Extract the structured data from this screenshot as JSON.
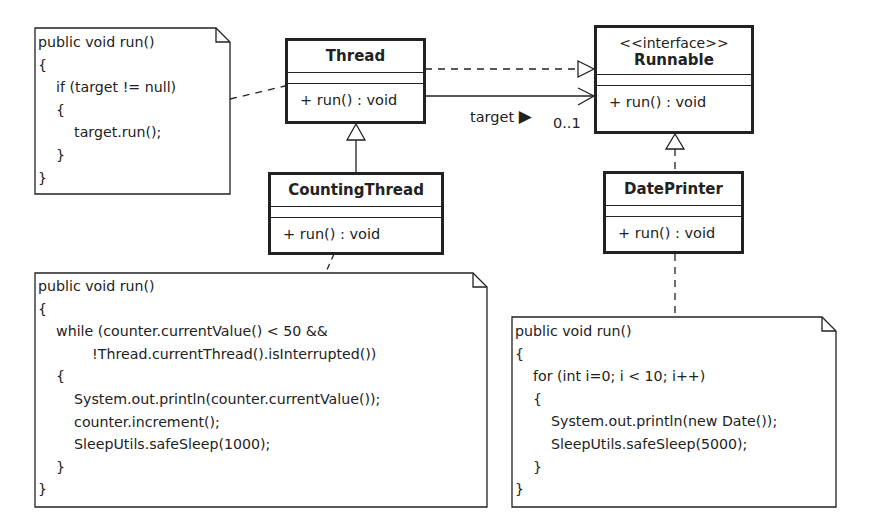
{
  "diagram": {
    "type": "UML class diagram",
    "classes": {
      "thread": {
        "name": "Thread",
        "operations": [
          "+ run() : void"
        ]
      },
      "runnable": {
        "stereotype": "<<interface>>",
        "name": "Runnable",
        "operations": [
          "+ run() : void"
        ]
      },
      "counting_thread": {
        "name": "CountingThread",
        "operations": [
          "+ run() : void"
        ]
      },
      "date_printer": {
        "name": "DatePrinter",
        "operations": [
          "+ run() : void"
        ]
      }
    },
    "association": {
      "role": "target",
      "direction_marker": "▶",
      "multiplicity": "0..1"
    },
    "notes": {
      "thread_run": {
        "lines": [
          "public void run()",
          "{",
          "    if (target != null)",
          "    {",
          "        target.run();",
          "    }",
          "}"
        ]
      },
      "counting_thread_run": {
        "lines": [
          "public void run()",
          "{",
          "    while (counter.currentValue() < 50 &&",
          "            !Thread.currentThread().isInterrupted())",
          "    {",
          "        System.out.println(counter.currentValue());",
          "        counter.increment();",
          "        SleepUtils.safeSleep(1000);",
          "    }",
          "}"
        ]
      },
      "date_printer_run": {
        "lines": [
          "public void run()",
          "{",
          "    for (int i=0; i < 10; i++)",
          "    {",
          "        System.out.println(new Date());",
          "        SleepUtils.safeSleep(5000);",
          "    }",
          "}"
        ]
      }
    },
    "relationships": [
      {
        "from": "Thread",
        "to": "Runnable",
        "kind": "realization"
      },
      {
        "from": "Thread",
        "to": "Runnable",
        "kind": "association",
        "role": "target",
        "multiplicity": "0..1"
      },
      {
        "from": "CountingThread",
        "to": "Thread",
        "kind": "generalization"
      },
      {
        "from": "DatePrinter",
        "to": "Runnable",
        "kind": "realization"
      }
    ]
  }
}
